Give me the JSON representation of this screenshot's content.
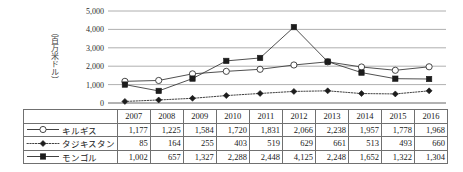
{
  "chart_data": {
    "type": "line",
    "title": "",
    "xlabel": "",
    "ylabel": "（百万米ドル）",
    "ylim": [
      0,
      5000
    ],
    "ytick_labels": [
      "0",
      "1,000",
      "2,000",
      "3,000",
      "4,000",
      "5,000"
    ],
    "ytick_values": [
      0,
      1000,
      2000,
      3000,
      4000,
      5000
    ],
    "grid": true,
    "legend_position": "table-left",
    "categories": [
      "2007",
      "2008",
      "2009",
      "2010",
      "2011",
      "2012",
      "2013",
      "2014",
      "2015",
      "2016"
    ],
    "series": [
      {
        "name": "キルギス",
        "marker": "open-circle",
        "line_style": "solid",
        "values": [
          1177,
          1225,
          1584,
          1720,
          1831,
          2066,
          2238,
          1957,
          1778,
          1968
        ],
        "labels": [
          "1,177",
          "1,225",
          "1,584",
          "1,720",
          "1,831",
          "2,066",
          "2,238",
          "1,957",
          "1,778",
          "1,968"
        ]
      },
      {
        "name": "タジキスタン",
        "marker": "filled-diamond",
        "line_style": "dotted",
        "values": [
          85,
          164,
          255,
          403,
          519,
          629,
          661,
          513,
          493,
          660
        ],
        "labels": [
          "85",
          "164",
          "255",
          "403",
          "519",
          "629",
          "661",
          "513",
          "493",
          "660"
        ]
      },
      {
        "name": "モンゴル",
        "marker": "filled-square",
        "line_style": "solid",
        "values": [
          1002,
          657,
          1327,
          2288,
          2448,
          4125,
          2248,
          1652,
          1322,
          1304
        ],
        "labels": [
          "1,002",
          "657",
          "1,327",
          "2,288",
          "2,448",
          "4,125",
          "2,248",
          "1,652",
          "1,322",
          "1,304"
        ]
      }
    ]
  },
  "table": {
    "corner_label": "",
    "column_headers": [
      "2007",
      "2008",
      "2009",
      "2010",
      "2011",
      "2012",
      "2013",
      "2014",
      "2015",
      "2016"
    ],
    "rows": [
      {
        "label": "キルギス",
        "marker": "open-circle",
        "line_style": "solid",
        "values": [
          "1,177",
          "1,225",
          "1,584",
          "1,720",
          "1,831",
          "2,066",
          "2,238",
          "1,957",
          "1,778",
          "1,968"
        ]
      },
      {
        "label": "タジキスタン",
        "marker": "filled-diamond",
        "line_style": "dotted",
        "values": [
          "85",
          "164",
          "255",
          "403",
          "519",
          "629",
          "661",
          "513",
          "493",
          "660"
        ]
      },
      {
        "label": "モンゴル",
        "marker": "filled-square",
        "line_style": "solid",
        "values": [
          "1,002",
          "657",
          "1,327",
          "2,288",
          "2,448",
          "4,125",
          "2,248",
          "1,652",
          "1,322",
          "1,304"
        ]
      }
    ]
  },
  "colors": {
    "gridline": "#9a9a9a",
    "axis": "#555555",
    "series_stroke": "#3c3c3c",
    "marker_fill_dark": "#1c1c1c",
    "marker_fill_light": "#ffffff",
    "table_border": "#707070",
    "text": "#1a1a1a"
  }
}
